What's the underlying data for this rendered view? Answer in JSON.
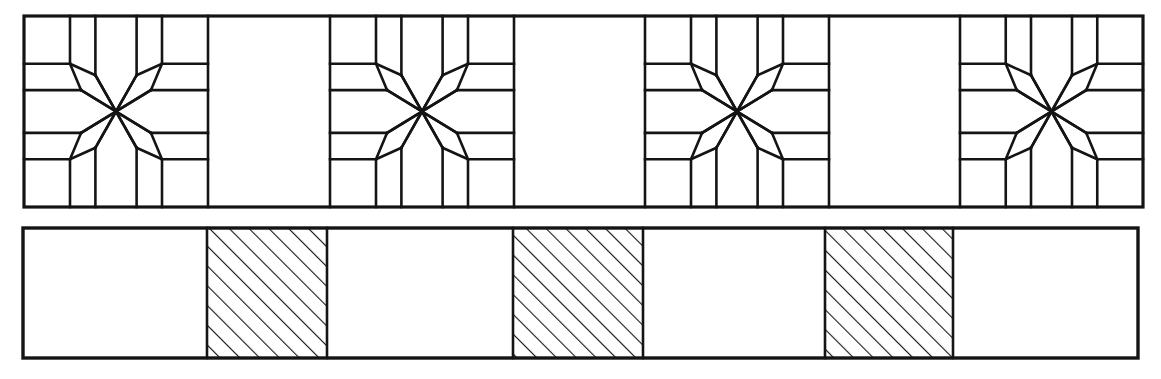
{
  "figure": {
    "kind": "quilt-border-line-drawing",
    "background_color": "#ffffff",
    "ink_color": "#141414",
    "canvas": {
      "width": 1161,
      "height": 379
    }
  },
  "strips": [
    {
      "name": "star-border-strip",
      "label": "Eight-pointed star border strip",
      "x": 24,
      "y": 16,
      "width": 1119,
      "height": 191,
      "outline_width": 3.2,
      "inner_width": 2.6,
      "cell_count": 7,
      "cell_boundaries": [
        24,
        208,
        330,
        514,
        645,
        829,
        960,
        1143
      ],
      "cells": [
        {
          "index": 0,
          "fill": "star",
          "label": "eight-point-star-block"
        },
        {
          "index": 1,
          "fill": "plain",
          "label": "plain-block"
        },
        {
          "index": 2,
          "fill": "star",
          "label": "eight-point-star-block"
        },
        {
          "index": 3,
          "fill": "plain",
          "label": "plain-block"
        },
        {
          "index": 4,
          "fill": "star",
          "label": "eight-point-star-block"
        },
        {
          "index": 5,
          "fill": "plain",
          "label": "plain-block"
        },
        {
          "index": 6,
          "fill": "star",
          "label": "eight-point-star-block"
        }
      ],
      "star_block": {
        "points": 8,
        "corner_square_fraction": 0.25,
        "diamond_half_width_fraction": 0.112,
        "description": "LeMoyne star: eight diamonds radiating from centre, four corner squares, four edge triangles"
      }
    },
    {
      "name": "checker-border-strip",
      "label": "Alternating hatched and plain border strip",
      "x": 23,
      "y": 228,
      "width": 1115,
      "height": 130,
      "outline_width": 3.4,
      "inner_width": 2.6,
      "cell_count": 7,
      "cell_boundaries": [
        23,
        207,
        327,
        513,
        643,
        825,
        953,
        1138
      ],
      "cells": [
        {
          "index": 0,
          "fill": "plain",
          "label": "plain-square"
        },
        {
          "index": 1,
          "fill": "hatched",
          "label": "hatched-square"
        },
        {
          "index": 2,
          "fill": "plain",
          "label": "plain-square"
        },
        {
          "index": 3,
          "fill": "hatched",
          "label": "hatched-square"
        },
        {
          "index": 4,
          "fill": "plain",
          "label": "plain-square"
        },
        {
          "index": 5,
          "fill": "hatched",
          "label": "hatched-square"
        },
        {
          "index": 6,
          "fill": "plain",
          "label": "plain-square"
        }
      ],
      "hatch": {
        "direction": "lower-left-to-upper-right",
        "angle_degrees": 45,
        "spacing_px": 14,
        "line_width": 2.2
      }
    }
  ]
}
